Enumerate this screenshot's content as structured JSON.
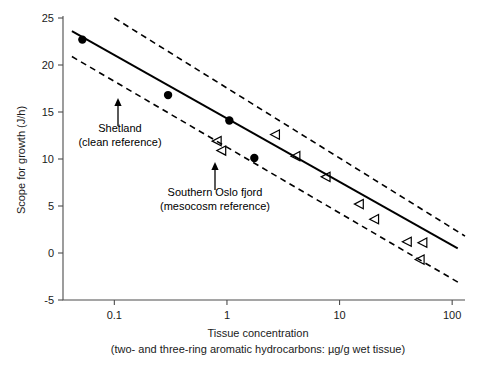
{
  "chart_data": {
    "type": "scatter",
    "title": "",
    "xlabel": "Tissue concentration",
    "xlabel_sub": "(two- and three-ring aromatic hydrocarbons: µg/g wet tissue)",
    "ylabel": "Scope for growth (J/h)",
    "xscale": "log",
    "xlim": [
      0.035,
      130
    ],
    "ylim": [
      -5,
      25
    ],
    "xticks": [
      0.1,
      1,
      10,
      100
    ],
    "xticklabels": [
      "0.1",
      "1",
      "10",
      "100"
    ],
    "yticks": [
      -5,
      0,
      5,
      10,
      15,
      20,
      25
    ],
    "yticklabels": [
      "-5",
      "0",
      "5",
      "10",
      "15",
      "20",
      "25"
    ],
    "grid": false,
    "legend": "none",
    "series": [
      {
        "name": "field sites (filled circles)",
        "marker": "filled-circle",
        "points": [
          {
            "x": 0.052,
            "y": 22.7
          },
          {
            "x": 0.3,
            "y": 16.8
          },
          {
            "x": 1.05,
            "y": 14.1
          },
          {
            "x": 1.75,
            "y": 10.1
          }
        ]
      },
      {
        "name": "mesocosm samples (open triangles)",
        "marker": "open-left-triangle",
        "points": [
          {
            "x": 0.82,
            "y": 11.9
          },
          {
            "x": 0.9,
            "y": 10.9
          },
          {
            "x": 2.7,
            "y": 12.6
          },
          {
            "x": 4.1,
            "y": 10.3
          },
          {
            "x": 7.6,
            "y": 8.1
          },
          {
            "x": 15.0,
            "y": 5.2
          },
          {
            "x": 20.5,
            "y": 3.6
          },
          {
            "x": 40.0,
            "y": 1.2
          },
          {
            "x": 55.0,
            "y": 1.1
          },
          {
            "x": 52.0,
            "y": -0.7
          }
        ]
      }
    ],
    "fit_line": {
      "name": "regression line",
      "style": "solid",
      "endpoints": [
        {
          "x": 0.042,
          "y": 23.6
        },
        {
          "x": 112,
          "y": 0.5
        }
      ]
    },
    "confidence_bands": [
      {
        "name": "upper confidence limit",
        "style": "dashed",
        "endpoints": [
          {
            "x": 0.1,
            "y": 25.0
          },
          {
            "x": 130,
            "y": 1.8
          }
        ]
      },
      {
        "name": "lower confidence limit",
        "style": "dashed",
        "endpoints": [
          {
            "x": 0.042,
            "y": 20.9
          },
          {
            "x": 120,
            "y": -3.3
          }
        ]
      }
    ],
    "annotations": [
      {
        "name": "shetland-annotation",
        "lines": [
          "Shetland",
          "(clean reference)"
        ],
        "text_x": 120,
        "text_y": 132,
        "arrow_from": {
          "px": 118,
          "py": 126
        },
        "arrow_to": {
          "px": 118,
          "py": 98
        }
      },
      {
        "name": "oslo-fjord-annotation",
        "lines": [
          "Southern Oslo fjord",
          "(mesocosm reference)"
        ],
        "text_x": 215,
        "text_y": 196,
        "arrow_from": {
          "px": 215,
          "py": 190
        },
        "arrow_to": {
          "px": 215,
          "py": 162
        }
      }
    ]
  },
  "colors": {
    "axis": "#4d4d4d",
    "ink": "#000000",
    "background": "#ffffff"
  }
}
